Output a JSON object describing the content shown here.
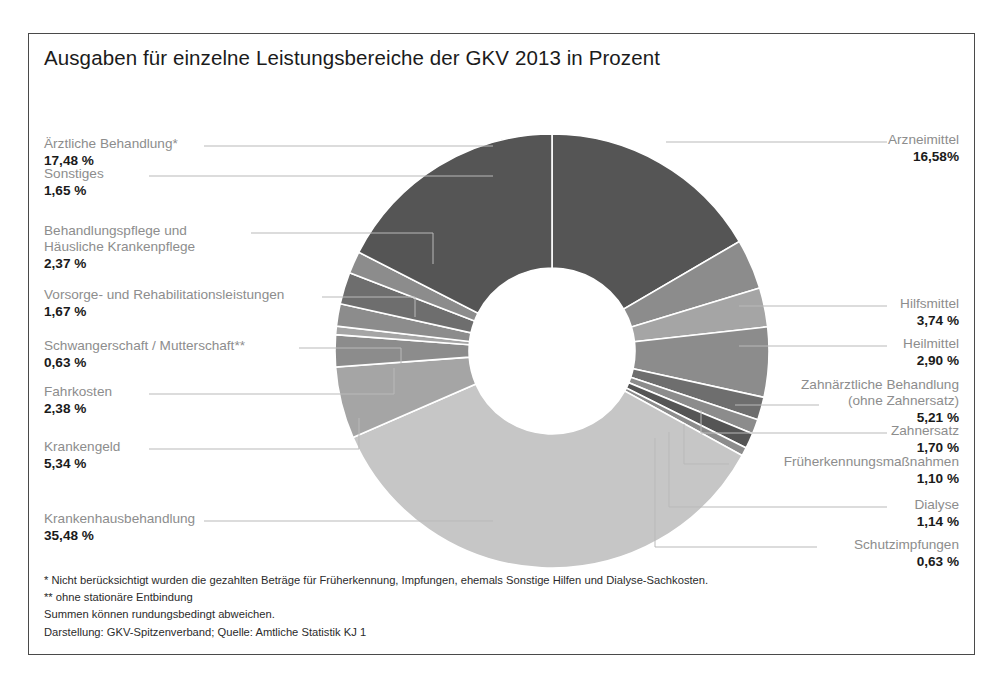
{
  "title": "Ausgaben für einzelne Leistungsbereiche der GKV 2013 in Prozent",
  "colors": {
    "dark": "#555555",
    "mid_dark": "#6e6e6e",
    "mid": "#8c8c8c",
    "mid_light": "#a5a5a5",
    "light": "#c6c6c6",
    "frame": "#4a4a4a",
    "label_text": "#8d8d8d",
    "value_text": "#1a1a1a",
    "leader": "#b9b9b9",
    "slice_gap": "#ffffff"
  },
  "chart_data": {
    "type": "pie",
    "variant": "donut",
    "title": "Ausgaben für einzelne Leistungsbereiche der GKV 2013 in Prozent",
    "unit": "%",
    "start_angle_deg": 0,
    "direction": "clockwise",
    "total": 100.0,
    "legend_position": "callouts",
    "categories": [
      "Arzneimittel",
      "Hilfsmittel",
      "Heilmittel",
      "Zahnärztliche Behandlung (ohne Zahnersatz)",
      "Zahnersatz",
      "Früherkennungsmaßnahmen",
      "Dialyse",
      "Schutzimpfungen",
      "Krankenhausbehandlung",
      "Krankengeld",
      "Fahrkosten",
      "Schwangerschaft / Mutterschaft**",
      "Vorsorge- und Rehabilitationsleistungen",
      "Behandlungspflege und Häusliche Krankenpflege",
      "Sonstiges",
      "Ärztliche Behandlung*"
    ],
    "values": [
      16.58,
      3.74,
      2.9,
      5.21,
      1.7,
      1.1,
      1.14,
      0.63,
      35.48,
      5.34,
      2.38,
      0.63,
      1.67,
      2.37,
      1.65,
      17.48
    ],
    "slices": [
      {
        "name": "Arzneimittel",
        "value": 16.58,
        "value_text": "16,58%",
        "color": "#555555",
        "side": "right"
      },
      {
        "name": "Hilfsmittel",
        "value": 3.74,
        "value_text": "3,74 %",
        "color": "#8c8c8c",
        "side": "right"
      },
      {
        "name": "Heilmittel",
        "value": 2.9,
        "value_text": "2,90 %",
        "color": "#a5a5a5",
        "side": "right"
      },
      {
        "name": "Zahnärztliche Behandlung (ohne Zahnersatz)",
        "value": 5.21,
        "value_text": "5,21 %",
        "color": "#8c8c8c",
        "side": "right"
      },
      {
        "name": "Zahnersatz",
        "value": 1.7,
        "value_text": "1,70 %",
        "color": "#6e6e6e",
        "side": "right"
      },
      {
        "name": "Früherkennungsmaßnahmen",
        "value": 1.1,
        "value_text": "1,10 %",
        "color": "#8c8c8c",
        "side": "right"
      },
      {
        "name": "Dialyse",
        "value": 1.14,
        "value_text": "1,14 %",
        "color": "#555555",
        "side": "right"
      },
      {
        "name": "Schutzimpfungen",
        "value": 0.63,
        "value_text": "0,63 %",
        "color": "#8c8c8c",
        "side": "right"
      },
      {
        "name": "Krankenhausbehandlung",
        "value": 35.48,
        "value_text": "35,48 %",
        "color": "#c6c6c6",
        "side": "left"
      },
      {
        "name": "Krankengeld",
        "value": 5.34,
        "value_text": "5,34 %",
        "color": "#a5a5a5",
        "side": "left"
      },
      {
        "name": "Fahrkosten",
        "value": 2.38,
        "value_text": "2,38 %",
        "color": "#8c8c8c",
        "side": "left"
      },
      {
        "name": "Schwangerschaft / Mutterschaft**",
        "value": 0.63,
        "value_text": "0,63 %",
        "color": "#a5a5a5",
        "side": "left"
      },
      {
        "name": "Vorsorge- und Rehabilitationsleistungen",
        "value": 1.67,
        "value_text": "1,67 %",
        "color": "#8c8c8c",
        "side": "left"
      },
      {
        "name": "Behandlungspflege und Häusliche Krankenpflege",
        "value": 2.37,
        "value_text": "2,37 %",
        "color": "#6e6e6e",
        "side": "left"
      },
      {
        "name": "Sonstiges",
        "value": 1.65,
        "value_text": "1,65 %",
        "color": "#8c8c8c",
        "side": "left"
      },
      {
        "name": "Ärztliche Behandlung*",
        "value": 17.48,
        "value_text": "17,48 %",
        "color": "#555555",
        "side": "left"
      }
    ]
  },
  "callouts": {
    "arzneimittel": {
      "label": "Arzneimittel",
      "value": "16,58%"
    },
    "hilfsmittel": {
      "label": "Hilfsmittel",
      "value": "3,74 %"
    },
    "heilmittel": {
      "label": "Heilmittel",
      "value": "2,90 %"
    },
    "zahnaerztliche": {
      "label": "Zahnärztliche Behandlung",
      "label2": "(ohne Zahnersatz)",
      "value": "5,21 %"
    },
    "zahnersatz": {
      "label": "Zahnersatz",
      "value": "1,70 %"
    },
    "frueherkennung": {
      "label": "Früherkennungsmaßnahmen",
      "value": "1,10 %"
    },
    "dialyse": {
      "label": "Dialyse",
      "value": "1,14 %"
    },
    "schutzimpfungen": {
      "label": "Schutzimpfungen",
      "value": "0,63 %"
    },
    "aerztliche": {
      "label": "Ärztliche Behandlung*",
      "value": "17,48 %"
    },
    "sonstiges": {
      "label": "Sonstiges",
      "value": "1,65 %"
    },
    "behandlungspflege": {
      "label": "Behandlungspflege und",
      "label2": "Häusliche Krankenpflege",
      "value": "2,37 %"
    },
    "vorsorge": {
      "label": "Vorsorge- und Rehabilitationsleistungen",
      "value": "1,67 %"
    },
    "schwangerschaft": {
      "label": "Schwangerschaft / Mutterschaft**",
      "value": "0,63 %"
    },
    "fahrkosten": {
      "label": "Fahrkosten",
      "value": "2,38 %"
    },
    "krankengeld": {
      "label": "Krankengeld",
      "value": "5,34 %"
    },
    "krankenhaus": {
      "label": "Krankenhausbehandlung",
      "value": "35,48 %"
    }
  },
  "footnotes": {
    "line1": "*  Nicht berücksichtigt wurden die gezahlten Beträge für Früherkennung, Impfungen, ehemals Sonstige Hilfen und Dialyse-Sachkosten.",
    "line2": "** ohne stationäre Entbindung",
    "line3": "Summen können rundungsbedingt abweichen.",
    "line4": "Darstellung: GKV-Spitzenverband; Quelle: Amtliche Statistik KJ 1"
  }
}
